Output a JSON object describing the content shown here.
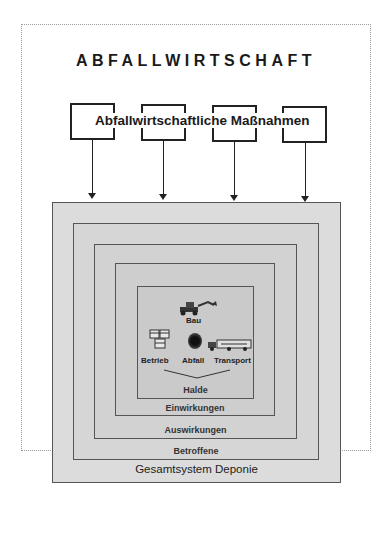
{
  "diagram": {
    "title": "ABFALLWIRTSCHAFT",
    "measures_label": "Abfallwirtschaftliche Maßnahmen",
    "measure_boxes": 4,
    "layers": [
      {
        "label": "Gesamtsystem Deponie"
      },
      {
        "label": "Betroffene"
      },
      {
        "label": "Auswirkungen"
      },
      {
        "label": "Einwirkungen"
      },
      {
        "label": "Halde"
      }
    ],
    "core": {
      "top": "Bau",
      "left": "Betrieb",
      "center": "Abfall",
      "right": "Transport",
      "icons": [
        "excavator-icon",
        "barrels-icon",
        "waste-blob-icon",
        "truck-icon"
      ]
    }
  }
}
